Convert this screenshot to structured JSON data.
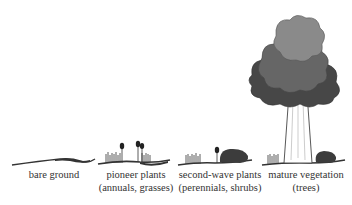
{
  "diagram": {
    "stages": [
      {
        "id": "bare-ground",
        "line1": "bare ground",
        "line2": ""
      },
      {
        "id": "pioneer",
        "line1": "pioneer plants",
        "line2": "(annuals, grasses)"
      },
      {
        "id": "second-wave",
        "line1": "second-wave plants",
        "line2": "(perennials, shrubs)"
      },
      {
        "id": "mature",
        "line1": "mature vegetation",
        "line2": "(trees)"
      }
    ],
    "colors": {
      "ground": "#2b2b2b",
      "canopy_light": "#8a8a8a",
      "canopy_mid": "#666666",
      "canopy_dark": "#474747",
      "shrub": "#3c3c3c"
    }
  }
}
